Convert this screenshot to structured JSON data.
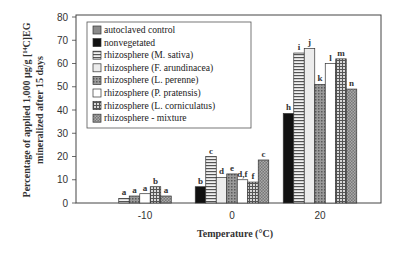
{
  "chart_data": {
    "type": "bar",
    "title": "",
    "xlabel": "Temperature (°C)",
    "ylabel_line1": "Percentage of applied 1,000 µg/g [¹⁴C]EG",
    "ylabel_line2": "mineralized after 15 days",
    "ylim": [
      0,
      80
    ],
    "yticks": [
      0,
      10,
      20,
      30,
      40,
      50,
      60,
      70,
      80
    ],
    "categories": [
      "-10",
      "0",
      "20"
    ],
    "grid": false,
    "legend_position": "upper-left-inside",
    "series": [
      {
        "name": "autoclaved control",
        "pattern": "gray",
        "values": [
          null,
          null,
          null
        ],
        "labels": [
          "",
          "",
          ""
        ]
      },
      {
        "name": "nonvegetated",
        "pattern": "black",
        "values": [
          null,
          7,
          38.5
        ],
        "labels": [
          "",
          "b",
          "h"
        ]
      },
      {
        "name": "rhizosphere (M. sativa)",
        "pattern": "hstripes",
        "values": [
          2,
          20,
          64.5
        ],
        "labels": [
          "a",
          "c",
          "i"
        ]
      },
      {
        "name": "rhizosphere (F. arundinacea)",
        "pattern": "lightgray",
        "values": [
          null,
          11,
          66.5
        ],
        "labels": [
          "",
          "d",
          "j"
        ]
      },
      {
        "name": "rhizosphere (L. perenne)",
        "pattern": "dots",
        "values": [
          3,
          12.5,
          51
        ],
        "labels": [
          "a",
          "e",
          "k"
        ]
      },
      {
        "name": "rhizosphere (P. pratensis)",
        "pattern": "white",
        "values": [
          4,
          10,
          60
        ],
        "labels": [
          "a",
          "d,f",
          "l"
        ]
      },
      {
        "name": "rhizosphere (L. corniculatus)",
        "pattern": "grid",
        "values": [
          7,
          9,
          62
        ],
        "labels": [
          "b",
          "f",
          "m"
        ]
      },
      {
        "name": "rhizosphere - mixture",
        "pattern": "darkdots",
        "values": [
          3,
          18.5,
          49
        ],
        "labels": [
          "a",
          "c",
          "n"
        ]
      }
    ]
  },
  "legend": {
    "items": [
      "autoclaved control",
      "nonvegetated",
      "rhizosphere (M. sativa)",
      "rhizosphere (F. arundinacea)",
      "rhizosphere (L. perenne)",
      "rhizosphere (P. pratensis)",
      "rhizosphere (L. corniculatus)",
      "rhizosphere - mixture"
    ]
  },
  "axes": {
    "y_ticks": [
      "0",
      "10",
      "20",
      "30",
      "40",
      "50",
      "60",
      "70",
      "80"
    ],
    "x_ticks": [
      "-10",
      "0",
      "20"
    ],
    "x_label": "Temperature (°C)",
    "y_label_1": "Percentage of applied 1,000 µg/g [¹⁴C]EG",
    "y_label_2": "mineralized after 15 days"
  }
}
